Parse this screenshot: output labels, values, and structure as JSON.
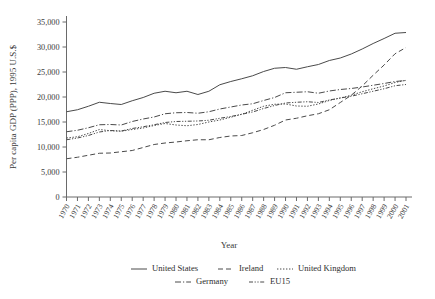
{
  "chart_data": {
    "type": "line",
    "title": "",
    "xlabel": "Year",
    "ylabel": "Per capita GDP (PPP), 1995 U.S.$",
    "ylim": [
      0,
      35000
    ],
    "yticks": [
      0,
      5000,
      10000,
      15000,
      20000,
      25000,
      30000,
      35000
    ],
    "ytick_labels": [
      "0",
      "5,000",
      "10,000",
      "15,000",
      "20,000",
      "25,000",
      "30,000",
      "35,000"
    ],
    "grid": false,
    "legend_position": "bottom",
    "x": [
      1970,
      1971,
      1972,
      1973,
      1974,
      1975,
      1976,
      1977,
      1978,
      1979,
      1980,
      1981,
      1982,
      1983,
      1984,
      1985,
      1986,
      1987,
      1988,
      1989,
      1990,
      1991,
      1992,
      1993,
      1994,
      1995,
      1996,
      1997,
      1998,
      1999,
      2000,
      2001
    ],
    "xtick_labels": [
      "1970",
      "1971",
      "1972",
      "1973",
      "1974",
      "1975",
      "1976",
      "1977",
      "1978",
      "1979",
      "1980",
      "1981",
      "1982",
      "1983",
      "1984",
      "1985",
      "1986",
      "1987",
      "1988",
      "1989",
      "1990",
      "1991",
      "1992",
      "1993",
      "1994",
      "1995",
      "1996",
      "1997",
      "1998",
      "1999",
      "2000",
      "2001"
    ],
    "series": [
      {
        "name": "United States",
        "style": "solid",
        "dash": "none",
        "values": [
          17050,
          17450,
          18150,
          18950,
          18700,
          18500,
          19250,
          19900,
          20750,
          21150,
          20850,
          21150,
          20500,
          21150,
          22450,
          23100,
          23650,
          24250,
          25100,
          25750,
          25900,
          25550,
          26050,
          26500,
          27300,
          27800,
          28600,
          29600,
          30700,
          31700,
          32750,
          32900
        ]
      },
      {
        "name": "Ireland",
        "style": "dashed",
        "dash": "5,3",
        "values": [
          7650,
          7950,
          8350,
          8750,
          8800,
          9050,
          9300,
          9900,
          10500,
          10800,
          11000,
          11250,
          11450,
          11450,
          11900,
          12200,
          12300,
          12850,
          13500,
          14350,
          15400,
          15750,
          16250,
          16650,
          17450,
          18900,
          20350,
          22200,
          24350,
          26400,
          28650,
          29900
        ]
      },
      {
        "name": "United Kingdom",
        "style": "dotted",
        "dash": "1.4,1.6",
        "values": [
          11800,
          12050,
          12700,
          13500,
          13250,
          13150,
          13500,
          13800,
          14300,
          14700,
          14400,
          14250,
          14500,
          15000,
          15400,
          15950,
          16550,
          17350,
          18150,
          18550,
          18600,
          18200,
          18150,
          18600,
          19300,
          19800,
          20350,
          21050,
          21650,
          22200,
          22900,
          23350
        ]
      },
      {
        "name": "Germany",
        "style": "dashdot",
        "dash": "6,2,1.2,2",
        "values": [
          13050,
          13350,
          13850,
          14450,
          14500,
          14400,
          15100,
          15600,
          16000,
          16650,
          16850,
          16900,
          16750,
          17050,
          17600,
          18000,
          18400,
          18650,
          19300,
          19900,
          20850,
          20950,
          21050,
          20750,
          21200,
          21500,
          21700,
          22000,
          22350,
          22700,
          23100,
          23300
        ]
      },
      {
        "name": "EU15",
        "style": "dashdotdot",
        "dash": "4,1.6,1.2,1.6,1.2,1.6",
        "values": [
          11450,
          11800,
          12300,
          13000,
          13300,
          13200,
          13700,
          14050,
          14450,
          14900,
          15100,
          15150,
          15200,
          15350,
          15750,
          16100,
          16550,
          17000,
          17700,
          18300,
          18800,
          18950,
          19050,
          18900,
          19400,
          19800,
          20150,
          20650,
          21150,
          21650,
          22250,
          22500
        ]
      }
    ]
  },
  "legend": {
    "rows": [
      [
        {
          "label": "United States",
          "key": "United States"
        },
        {
          "label": "Ireland",
          "key": "Ireland"
        },
        {
          "label": "United Kingdom",
          "key": "United Kingdom"
        }
      ],
      [
        {
          "label": "Germany",
          "key": "Germany"
        },
        {
          "label": "EU15",
          "key": "EU15"
        }
      ]
    ]
  }
}
